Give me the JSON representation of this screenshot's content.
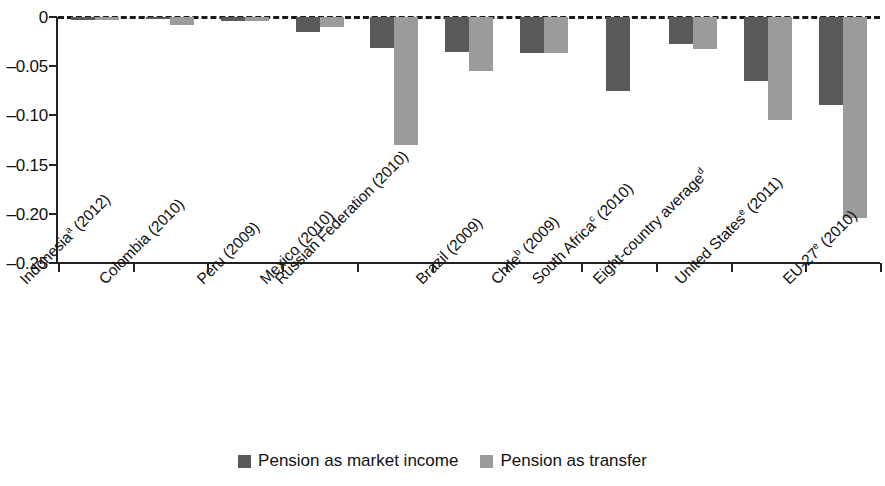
{
  "chart_data": {
    "type": "bar",
    "title": "",
    "subtitle": "",
    "xlabel": "",
    "ylabel": "",
    "ylim": [
      -0.25,
      0
    ],
    "grid": false,
    "legend_position": "bottom-center",
    "zero_reference_line": true,
    "categories": [
      "Indonesiaᵃ (2012)",
      "Colombia (2010)",
      "Peru (2009)",
      "Mexico (2010)",
      "Russian Federation (2010)",
      "Brazil (2009)",
      "Chileᵇ (2009)",
      "South Africaᶜ (2010)",
      "Eight-country averageᵈ",
      "United Statesᵉ (2011)",
      "EU-27ᵉ (2010)"
    ],
    "category_parts": [
      {
        "base": "Indonesia",
        "sup": "a",
        "tail": " (2012)"
      },
      {
        "base": "Colombia",
        "sup": "",
        "tail": " (2010)"
      },
      {
        "base": "Peru",
        "sup": "",
        "tail": " (2009)"
      },
      {
        "base": "Mexico",
        "sup": "",
        "tail": " (2010)"
      },
      {
        "base": "Russian Federation",
        "sup": "",
        "tail": " (2010)"
      },
      {
        "base": "Brazil",
        "sup": "",
        "tail": " (2009)"
      },
      {
        "base": "Chile",
        "sup": "b",
        "tail": " (2009)"
      },
      {
        "base": "South Africa",
        "sup": "c",
        "tail": " (2010)"
      },
      {
        "base": "Eight-country average",
        "sup": "d",
        "tail": ""
      },
      {
        "base": "United States",
        "sup": "e",
        "tail": " (2011)"
      },
      {
        "base": "EU-27",
        "sup": "e",
        "tail": " (2010)"
      }
    ],
    "ytick_labels": [
      "0",
      "–0.05",
      "–0.10",
      "–0.15",
      "–0.20",
      "–0.25"
    ],
    "ytick_values": [
      0,
      -0.05,
      -0.1,
      -0.15,
      -0.2,
      -0.25
    ],
    "series": [
      {
        "name": "Pension as market income",
        "color": "#595959",
        "values": [
          -0.003,
          -0.002,
          -0.004,
          -0.015,
          -0.032,
          -0.036,
          -0.037,
          -0.075,
          -0.027,
          -0.065,
          -0.089
        ]
      },
      {
        "name": "Pension as transfer",
        "color": "#9b9b9b",
        "values": [
          -0.003,
          -0.008,
          -0.004,
          -0.01,
          -0.13,
          -0.055,
          -0.037,
          null,
          -0.033,
          -0.105,
          -0.204
        ]
      }
    ]
  },
  "legend": {
    "items": [
      {
        "label": "Pension as market income",
        "color": "#595959"
      },
      {
        "label": "Pension as transfer",
        "color": "#9b9b9b"
      }
    ]
  },
  "colors": {
    "dark_bar": "#595959",
    "light_bar": "#9b9b9b",
    "axis": "#222222",
    "text": "#111111",
    "background": "#ffffff"
  }
}
